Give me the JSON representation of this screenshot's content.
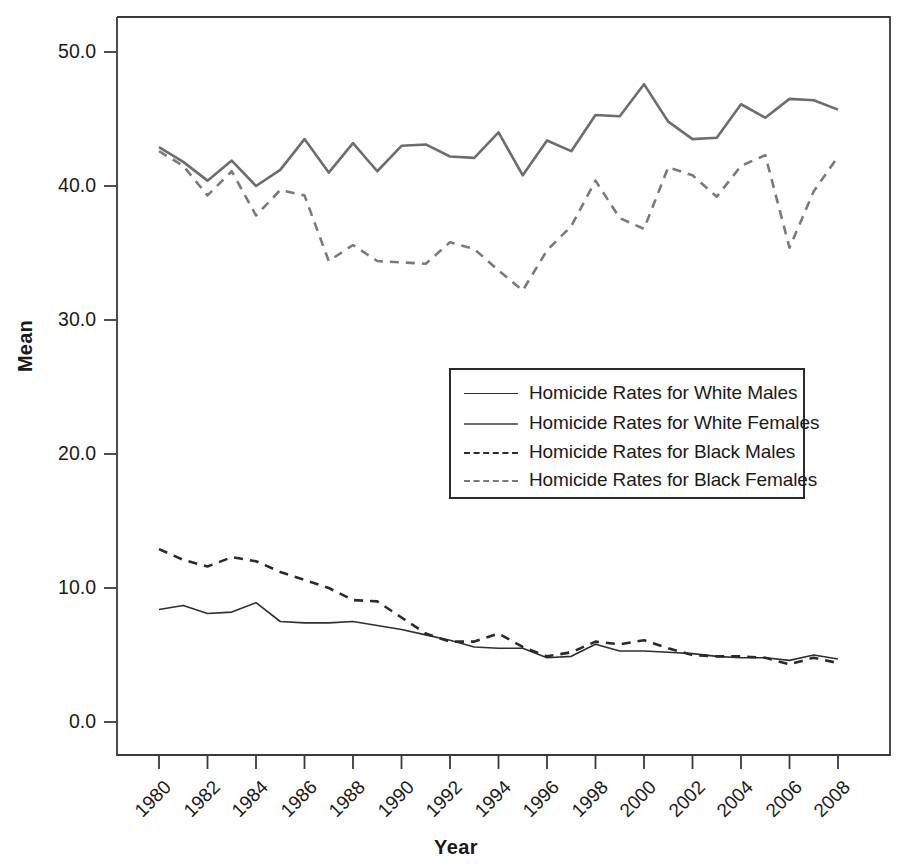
{
  "chart_data": {
    "type": "line",
    "title": "",
    "xlabel": "Year",
    "ylabel": "Mean",
    "xlim": [
      1980,
      2008
    ],
    "ylim": [
      0.0,
      50.0
    ],
    "grid": false,
    "legend_position": "center-right",
    "x": [
      1980,
      1981,
      1982,
      1983,
      1984,
      1985,
      1986,
      1987,
      1988,
      1989,
      1990,
      1991,
      1992,
      1993,
      1994,
      1995,
      1996,
      1997,
      1998,
      1999,
      2000,
      2001,
      2002,
      2003,
      2004,
      2005,
      2006,
      2007,
      2008
    ],
    "xtick_labels": [
      "1980",
      "1982",
      "1984",
      "1986",
      "1988",
      "1990",
      "1992",
      "1994",
      "1996",
      "1998",
      "2000",
      "2002",
      "2004",
      "2006",
      "2008"
    ],
    "xtick_values": [
      1980,
      1982,
      1984,
      1986,
      1988,
      1990,
      1992,
      1994,
      1996,
      1998,
      2000,
      2002,
      2004,
      2006,
      2008
    ],
    "ytick_labels": [
      "0.0",
      "10.0",
      "20.0",
      "30.0",
      "40.0",
      "50.0"
    ],
    "ytick_values": [
      0.0,
      10.0,
      20.0,
      30.0,
      40.0,
      50.0
    ],
    "series": [
      {
        "name": "Homicide Rates for White Males",
        "style": "solid",
        "color": "#2f2f2f",
        "width": 1.6,
        "values": [
          8.4,
          8.7,
          8.1,
          8.2,
          8.9,
          7.5,
          7.4,
          7.4,
          7.5,
          7.2,
          6.9,
          6.5,
          6.1,
          5.6,
          5.5,
          5.5,
          4.8,
          4.9,
          5.8,
          5.3,
          5.3,
          5.2,
          5.1,
          4.9,
          4.8,
          4.8,
          4.6,
          5.0,
          4.7
        ]
      },
      {
        "name": "Homicide Rates for White Females",
        "style": "solid",
        "color": "#6d6d6d",
        "width": 2.6,
        "values": [
          42.9,
          41.8,
          40.4,
          41.9,
          40.0,
          41.2,
          43.5,
          41.0,
          43.2,
          41.1,
          43.0,
          43.1,
          42.2,
          42.1,
          44.0,
          40.8,
          43.4,
          42.6,
          45.3,
          45.2,
          47.6,
          44.8,
          43.5,
          43.6,
          46.1,
          45.1,
          46.5,
          46.4,
          45.7
        ]
      },
      {
        "name": "Homicide Rates for Black Males",
        "style": "dashed",
        "color": "#2b2b2b",
        "width": 2.6,
        "values": [
          12.9,
          12.1,
          11.6,
          12.3,
          12.0,
          11.2,
          10.6,
          10.0,
          9.1,
          9.0,
          7.8,
          6.6,
          6.0,
          6.0,
          6.6,
          5.6,
          4.9,
          5.2,
          6.0,
          5.8,
          6.1,
          5.5,
          5.0,
          4.9,
          4.9,
          4.8,
          4.3,
          4.8,
          4.4
        ]
      },
      {
        "name": "Homicide Rates for Black Females",
        "style": "dashed",
        "color": "#7a7a7a",
        "width": 2.6,
        "values": [
          42.6,
          41.5,
          39.3,
          41.1,
          37.8,
          39.7,
          39.3,
          34.4,
          35.6,
          34.4,
          34.3,
          34.2,
          35.8,
          35.3,
          33.7,
          32.2,
          35.2,
          37.0,
          40.4,
          37.6,
          36.8,
          41.4,
          40.8,
          39.2,
          41.5,
          42.3,
          35.4,
          39.6,
          42.2
        ]
      }
    ]
  },
  "axes": {
    "y_title": "Mean",
    "x_title": "Year"
  },
  "legend": {
    "entries": [
      {
        "label": "Homicide Rates for White Males",
        "swatch": "solid-dark-line-icon"
      },
      {
        "label": "Homicide Rates for White Females",
        "swatch": "solid-grey-line-icon"
      },
      {
        "label": "Homicide Rates for Black Males",
        "swatch": "dashed-dark-line-icon"
      },
      {
        "label": "Homicide Rates for Black Females",
        "swatch": "dashed-grey-line-icon"
      }
    ]
  }
}
